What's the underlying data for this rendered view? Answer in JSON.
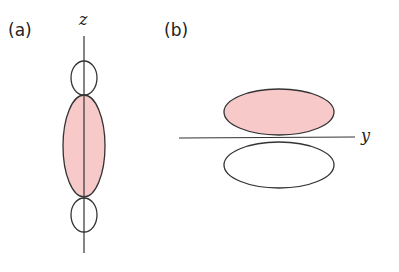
{
  "panels": [
    {
      "label": "(a)",
      "axis_label": "z",
      "description": "p orbital lobes along z axis: small top lobe, large shaded center lobe, small bottom lobe"
    },
    {
      "label": "(b)",
      "axis_label": "y",
      "description": "two lobes above and below the y axis; upper lobe shaded, lower lobe unshaded"
    }
  ],
  "colors": {
    "shaded_fill": "#f7c9c9",
    "stroke": "#333333",
    "background": "#ffffff"
  }
}
